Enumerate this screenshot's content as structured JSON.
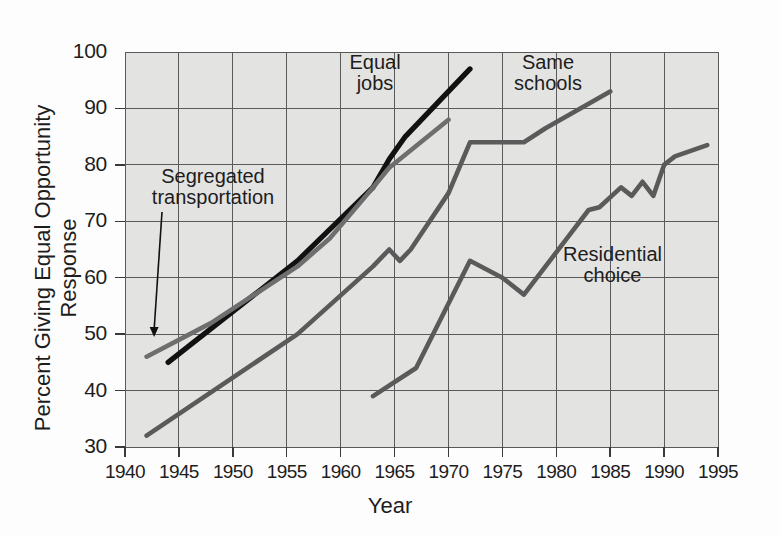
{
  "chart_data": {
    "type": "line",
    "title": "",
    "xlabel": "Year",
    "ylabel": "Percent Giving Equal Opportunity Response",
    "xlim": [
      1940,
      1995
    ],
    "ylim": [
      30,
      100
    ],
    "xticks": [
      1940,
      1945,
      1950,
      1955,
      1960,
      1965,
      1970,
      1975,
      1980,
      1985,
      1990,
      1995
    ],
    "yticks": [
      30,
      40,
      50,
      60,
      70,
      80,
      90,
      100
    ],
    "grid": true,
    "legend_position": "inline-annotations",
    "series": [
      {
        "name": "Equal jobs",
        "color": "#111111",
        "label_text": "Equal\njobs",
        "points": [
          {
            "x": 1944,
            "y": 45
          },
          {
            "x": 1946,
            "y": 48
          },
          {
            "x": 1956,
            "y": 63
          },
          {
            "x": 1963,
            "y": 76
          },
          {
            "x": 1964.5,
            "y": 81
          },
          {
            "x": 1966,
            "y": 85
          },
          {
            "x": 1972,
            "y": 97
          }
        ]
      },
      {
        "name": "Segregated transportation",
        "color": "#6e6e6e",
        "label_text": "Segregated\ntransportation",
        "points": [
          {
            "x": 1942,
            "y": 46
          },
          {
            "x": 1948,
            "y": 52
          },
          {
            "x": 1956,
            "y": 62
          },
          {
            "x": 1959,
            "y": 67
          },
          {
            "x": 1963,
            "y": 76
          },
          {
            "x": 1964.5,
            "y": 79.5
          },
          {
            "x": 1970,
            "y": 88
          }
        ]
      },
      {
        "name": "Same schools",
        "color": "#5a5a5a",
        "label_text": "Same\nschools",
        "points": [
          {
            "x": 1942,
            "y": 32
          },
          {
            "x": 1956,
            "y": 50
          },
          {
            "x": 1963,
            "y": 62
          },
          {
            "x": 1964.5,
            "y": 65
          },
          {
            "x": 1965.5,
            "y": 63
          },
          {
            "x": 1966.5,
            "y": 65
          },
          {
            "x": 1970,
            "y": 75
          },
          {
            "x": 1972,
            "y": 84
          },
          {
            "x": 1977,
            "y": 84
          },
          {
            "x": 1979,
            "y": 86.5
          },
          {
            "x": 1985,
            "y": 93
          }
        ]
      },
      {
        "name": "Residential choice",
        "color": "#5a5a5a",
        "label_text": "Residential\nchoice",
        "points": [
          {
            "x": 1963,
            "y": 39
          },
          {
            "x": 1967,
            "y": 44
          },
          {
            "x": 1972,
            "y": 63
          },
          {
            "x": 1975,
            "y": 60
          },
          {
            "x": 1977,
            "y": 57
          },
          {
            "x": 1981,
            "y": 67
          },
          {
            "x": 1983,
            "y": 72
          },
          {
            "x": 1984,
            "y": 72.5
          },
          {
            "x": 1986,
            "y": 76
          },
          {
            "x": 1987,
            "y": 74.5
          },
          {
            "x": 1988,
            "y": 77
          },
          {
            "x": 1989,
            "y": 74.5
          },
          {
            "x": 1990,
            "y": 80
          },
          {
            "x": 1991,
            "y": 81.5
          },
          {
            "x": 1994,
            "y": 83.5
          }
        ]
      }
    ],
    "annotations": [
      {
        "text": "Segregated transportation",
        "target": {
          "x": 1942.7,
          "y": 49.5
        },
        "arrow": true
      }
    ]
  }
}
